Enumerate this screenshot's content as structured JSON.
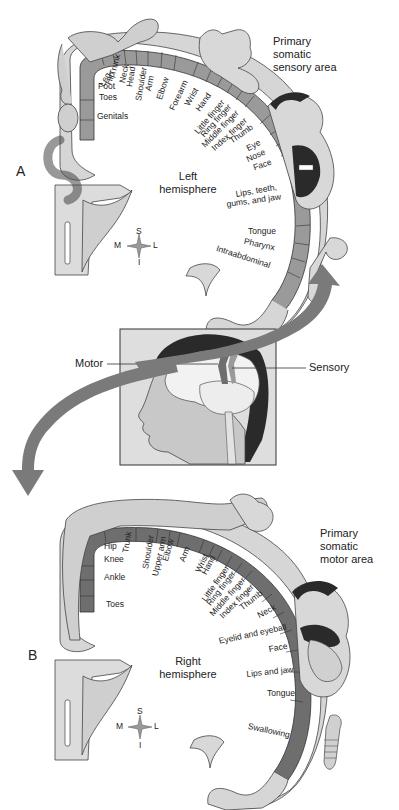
{
  "figure": {
    "panel_a": {
      "letter": "A",
      "title_lines": [
        "Primary",
        "somatic",
        "sensory area"
      ],
      "hemisphere_lines": [
        "Left",
        "hemisphere"
      ],
      "compass": {
        "superior": "S",
        "inferior": "I",
        "medial": "M",
        "lateral": "L"
      },
      "labels": [
        "Leg",
        "Hip",
        "Trunk",
        "Neck",
        "Head",
        "Shoulder",
        "Arm",
        "Elbow",
        "Forearm",
        "Wrist",
        "Hand",
        "Little finger",
        "Ring finger",
        "Middle finger",
        "Index finger",
        "Thumb",
        "Eye",
        "Nose",
        "Face",
        "Lips, teeth,",
        "gums, and jaw",
        "Tongue",
        "Pharynx",
        "Intraabdominal",
        "Foot",
        "Toes",
        "Genitals"
      ]
    },
    "center_inset": {
      "motor_label": "Motor",
      "sensory_label": "Sensory"
    },
    "panel_b": {
      "letter": "B",
      "title_lines": [
        "Primary",
        "somatic",
        "motor area"
      ],
      "hemisphere_lines": [
        "Right",
        "hemisphere"
      ],
      "compass": {
        "superior": "S",
        "inferior": "I",
        "medial": "M",
        "lateral": "L"
      },
      "labels": [
        "Hip",
        "Trunk",
        "Knee",
        "Ankle",
        "Toes",
        "Shoulder",
        "Upper arm",
        "Elbow",
        "Arm",
        "Wrist",
        "Hand",
        "Little finger",
        "Ring finger",
        "Middle finger",
        "Index finger",
        "Thumb",
        "Neck",
        "Eyelid and eyeball",
        "Face",
        "Lips and jaw",
        "Tongue",
        "Swallowing"
      ]
    },
    "colors": {
      "cortex_sensory": "#9a9a9a",
      "cortex_motor": "#6e6e6e",
      "body_fill": "#d4d4d4",
      "arrow": "#7a7a7a",
      "outline": "#333333",
      "hair": "#2a2a2a"
    }
  }
}
